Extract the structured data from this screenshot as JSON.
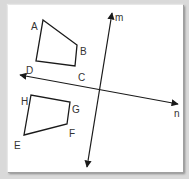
{
  "diagram": {
    "background": "#d9d9d9",
    "panel_color": "#ffffff",
    "stroke_color": "#1a1a1a",
    "quadrilaterals": [
      {
        "name": "ABCD",
        "vertices": [
          {
            "label": "A",
            "x": 43,
            "y": 20,
            "lx": 31,
            "ly": 22
          },
          {
            "label": "B",
            "x": 77,
            "y": 45,
            "lx": 80,
            "ly": 47
          },
          {
            "label": "C",
            "x": 75,
            "y": 66,
            "lx": 78,
            "ly": 73
          },
          {
            "label": "D",
            "x": 36,
            "y": 61,
            "lx": 26,
            "ly": 66
          }
        ]
      },
      {
        "name": "EFGH",
        "vertices": [
          {
            "label": "E",
            "x": 24,
            "y": 135,
            "lx": 14,
            "ly": 141
          },
          {
            "label": "F",
            "x": 67,
            "y": 124,
            "lx": 69,
            "ly": 129
          },
          {
            "label": "G",
            "x": 70,
            "y": 102,
            "lx": 72,
            "ly": 105
          },
          {
            "label": "H",
            "x": 31,
            "y": 95,
            "lx": 21,
            "ly": 97
          }
        ]
      }
    ],
    "lines": [
      {
        "label": "m",
        "x1": 87,
        "y1": 167,
        "x2": 112,
        "y2": 13,
        "lx": 115,
        "ly": 21,
        "both_arrows": true
      },
      {
        "label": "n",
        "x1": 20,
        "y1": 75,
        "x2": 178,
        "y2": 104,
        "lx": 174,
        "ly": 117,
        "both_arrows": true
      }
    ]
  }
}
